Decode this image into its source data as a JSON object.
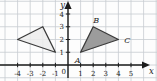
{
  "figure": {
    "background": "#fdfdfd",
    "grid_color": "#c7cbd1",
    "axis_color": "#1c1c1c",
    "text_color": "#1c1c1c"
  },
  "chart_data": {
    "type": "scatter",
    "title": "",
    "xlabel": "x",
    "ylabel": "y",
    "xlim": [
      -5.4,
      7.05
    ],
    "ylim": [
      -1.25,
      5.1
    ],
    "x_ticks": [
      -4,
      -3,
      -2,
      -1,
      1,
      2,
      3,
      4,
      5
    ],
    "y_ticks": [
      1,
      2,
      3,
      4
    ],
    "origin_label": "0",
    "grid": true,
    "legend": false,
    "shapes": [
      {
        "name": "reflected-triangle",
        "fill": "#ececec",
        "fill_opacity": 0.85,
        "stroke": "#3b3b3b",
        "vertices": [
          [
            -4,
            2
          ],
          [
            -2,
            3
          ],
          [
            -1,
            1
          ]
        ],
        "vertex_labels": []
      },
      {
        "name": "triangle-abc",
        "fill": "#9c9c9c",
        "fill_opacity": 1,
        "stroke": "#3b3b3b",
        "vertices": [
          [
            1,
            1
          ],
          [
            2,
            3
          ],
          [
            4,
            2
          ]
        ],
        "vertex_labels": [
          {
            "text": "A",
            "vertex": [
              1,
              1
            ],
            "dx": -3,
            "dy": 11
          },
          {
            "text": "B",
            "vertex": [
              2,
              3
            ],
            "dx": 3,
            "dy": -4
          },
          {
            "text": "C",
            "vertex": [
              4,
              2
            ],
            "dx": 9,
            "dy": 3
          }
        ]
      }
    ]
  }
}
